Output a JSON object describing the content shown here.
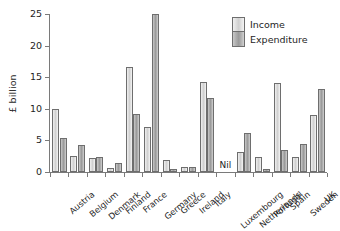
{
  "chart_data": {
    "type": "bar",
    "title": "",
    "xlabel": "",
    "ylabel": "£ billion",
    "ylim": [
      0,
      25
    ],
    "yticks": [
      0,
      5,
      10,
      15,
      20,
      25
    ],
    "ytick_labels": [
      "0",
      "5",
      "10",
      "15",
      "20",
      "25"
    ],
    "grid": false,
    "legend_position": "top-right",
    "categories": [
      "Austria",
      "Belgium",
      "Denmark",
      "Finland",
      "France",
      "Germany",
      "Greece",
      "Ireland",
      "Italy",
      "Luxembourg",
      "Netherlands",
      "Portugal",
      "Spain",
      "Sweden",
      "UK"
    ],
    "series": [
      {
        "name": "Income",
        "color": "#d8d8d8",
        "values": [
          9.9,
          2.6,
          2.2,
          0.6,
          16.6,
          7.2,
          1.9,
          0.8,
          14.3,
          0,
          3.1,
          2.3,
          14.1,
          2.3,
          9.0
        ]
      },
      {
        "name": "Expenditure",
        "color": "#a8a8a8",
        "values": [
          5.4,
          4.3,
          2.3,
          1.4,
          9.2,
          25.0,
          0.5,
          0.75,
          11.7,
          0,
          6.1,
          0.55,
          3.5,
          4.4,
          13.2
        ]
      }
    ],
    "annotations": [
      {
        "category": "Luxembourg",
        "text": "Nil"
      }
    ]
  },
  "legend": {
    "items": [
      {
        "label": "Income"
      },
      {
        "label": "Expenditure"
      }
    ]
  }
}
